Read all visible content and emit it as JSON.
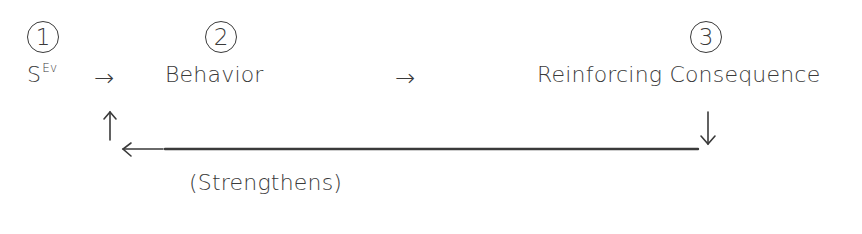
{
  "diagram": {
    "steps": [
      {
        "number": "1",
        "label": "S",
        "label_sup": "Ev"
      },
      {
        "number": "2",
        "label": "Behavior"
      },
      {
        "number": "3",
        "label": "Reinforcing Consequence"
      }
    ],
    "arrows": {
      "forward_1": "→",
      "forward_2": "→",
      "up": "↑",
      "down": "↓",
      "left": "←"
    },
    "feedback_label": "(Strengthens)",
    "colors": {
      "ink": "#3a3a3a",
      "background": "#ffffff"
    }
  }
}
